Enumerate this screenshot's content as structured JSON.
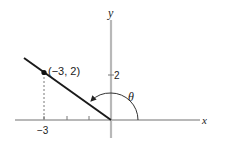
{
  "diagram": {
    "type": "coordinate-plane-angle",
    "axes": {
      "x_label": "x",
      "y_label": "y",
      "axis_color": "#b8b8b8"
    },
    "point": {
      "label": "(−3, 2)",
      "x": -3,
      "y": 2
    },
    "ticks": {
      "x_tick_label": "−3",
      "y_tick_label": "2"
    },
    "angle": {
      "label": "θ",
      "description": "angle from positive x-axis to terminal ray through (-3, 2)"
    },
    "ray_color": "#1a1a1a",
    "dashed_line": "vertical projection from (-3, 2) to x-axis"
  }
}
